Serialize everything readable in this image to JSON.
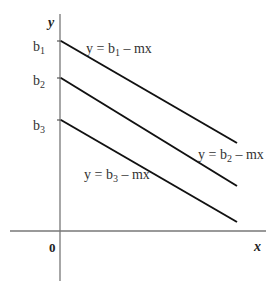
{
  "diagram": {
    "axes": {
      "x_label": "x",
      "y_label": "y",
      "origin_label": "0"
    },
    "intercepts": [
      {
        "base": "b",
        "sub": "1"
      },
      {
        "base": "b",
        "sub": "2"
      },
      {
        "base": "b",
        "sub": "3"
      }
    ],
    "lines": [
      {
        "prefix": "y = b",
        "sub": "1",
        "suffix": " – mx"
      },
      {
        "prefix": "y = b",
        "sub": "2",
        "suffix": " – mx"
      },
      {
        "prefix": "y = b",
        "sub": "3",
        "suffix": " – mx"
      }
    ],
    "colors": {
      "line": "#111111",
      "axis": "#666666",
      "text": "#333333"
    }
  }
}
